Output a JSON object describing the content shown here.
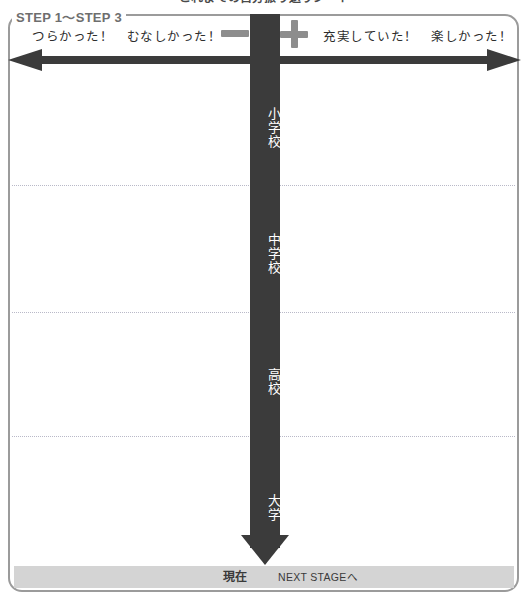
{
  "worksheet": {
    "title": "これまでの自分振り返りシート"
  },
  "step_section": {
    "legend": "STEP 1〜STEP 3",
    "negative_label": "つらかった！　むなしかった！",
    "positive_label": "充実していた！　楽しかった！",
    "minus_icon": "minus-icon",
    "plus_icon": "plus-icon",
    "left_arrow_icon": "arrow-left-icon",
    "right_arrow_icon": "arrow-right-icon"
  },
  "timeline": {
    "down_arrow_icon": "arrow-down-icon",
    "stages": [
      {
        "label": "小学校"
      },
      {
        "label": "中学校"
      },
      {
        "label": "高校"
      },
      {
        "label": "大学"
      }
    ]
  },
  "footer": {
    "current_label": "現在",
    "next_stage_label": "NEXT STAGEへ"
  },
  "colors": {
    "frame_border": "#9b9b9b",
    "timeline_bar": "#3b3b3b",
    "sign_gray": "#8d8d8d",
    "footer_bar": "#d4d4d4",
    "divider": "#b9b9c8",
    "legend_text": "#6e6e6e"
  }
}
